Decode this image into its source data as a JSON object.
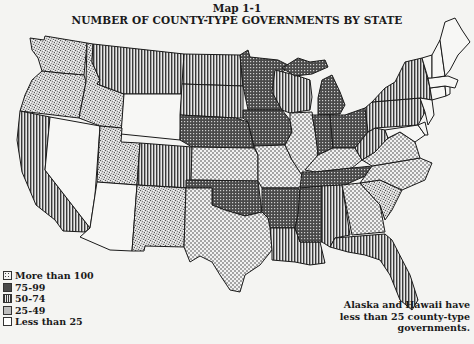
{
  "header": {
    "map_number": "Map 1-1",
    "title": "NUMBER OF COUNTY-TYPE GOVERNMENTS BY STATE"
  },
  "legend": {
    "items": [
      {
        "label": "More than 100",
        "pattern": "light-dots"
      },
      {
        "label": "75-99",
        "pattern": "dark-crosshatch"
      },
      {
        "label": "50-74",
        "pattern": "vertical-lines"
      },
      {
        "label": "25-49",
        "pattern": "stipple"
      },
      {
        "label": "Less than 25",
        "pattern": "blank"
      }
    ]
  },
  "note": {
    "line1": "Alaska and Hawaii have",
    "line2": "less than 25 county-type",
    "line3": "governments."
  },
  "states": {
    "WA": "25-49",
    "OR": "25-49",
    "ID": "25-49",
    "UT": "25-49",
    "NM": "25-49",
    "SC": "25-49",
    "CA": "50-74",
    "MT": "50-74",
    "ND": "50-74",
    "SD": "50-74",
    "CO": "50-74",
    "WI": "50-74",
    "NY": "50-74",
    "PA": "50-74",
    "WV": "50-74",
    "LA": "50-74",
    "AL": "50-74",
    "FL": "50-74",
    "MN": "75-99",
    "NE": "75-99",
    "IA": "75-99",
    "MI": "75-99",
    "IN": "75-99",
    "OH": "75-99",
    "OK": "75-99",
    "AR": "75-99",
    "MS": "75-99",
    "TN": "75-99",
    "KS": "More than 100",
    "MO": "More than 100",
    "IL": "More than 100",
    "KY": "More than 100",
    "TX": "More than 100",
    "VA": "More than 100",
    "NC": "More than 100",
    "GA": "More than 100",
    "NV": "Less than 25",
    "AZ": "Less than 25",
    "WY": "Less than 25",
    "ME": "Less than 25",
    "NH": "Less than 25",
    "VT": "Less than 25",
    "MA": "Less than 25",
    "CT": "Less than 25",
    "RI": "Less than 25",
    "NJ": "Less than 25",
    "DE": "Less than 25",
    "MD": "Less than 25"
  }
}
